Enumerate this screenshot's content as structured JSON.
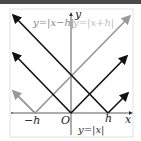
{
  "graph": {
    "axis_x_label": "x",
    "axis_y_label": "y",
    "origin_label": "O",
    "tick_neg_h": "−h",
    "tick_h": "h",
    "curves": [
      {
        "name": "abs-x",
        "label": "y=|x|",
        "color": "#111111",
        "vertex": "0"
      },
      {
        "name": "abs-x-minus-h",
        "label": "y=|x−h|",
        "color": "#111111",
        "vertex": "h"
      },
      {
        "name": "abs-x-plus-h",
        "label": "y=|x+h|",
        "color": "#999999",
        "vertex": "−h"
      }
    ]
  }
}
